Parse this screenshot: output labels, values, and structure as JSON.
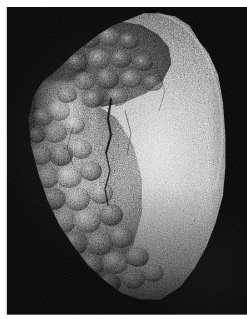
{
  "page": {
    "width": 247,
    "height": 319,
    "background_color": "#ffffff",
    "type": "photographic-plate"
  },
  "photo": {
    "name": "specimen-photograph",
    "subject": "mineral rock specimen",
    "background_color": "#050505",
    "frame": {
      "left": 7,
      "top": 7,
      "width": 240,
      "height": 308
    },
    "lighting": "directional light from upper right",
    "alt_text": "Grayscale photograph of an angular rock specimen on a black background"
  },
  "specimen": {
    "name": "rock-specimen",
    "outline": "irregular angular wedge, wider at top, tapering to a rounded point at lower right",
    "regions": [
      {
        "id": "bright-granular-face",
        "label": "bright fine-grained sugary face",
        "position": "right and centre",
        "tone": "#b4b4b4",
        "texture": "fine granular speckle"
      },
      {
        "id": "dark-crust-recess",
        "label": "dark recessed nodular crust",
        "position": "upper left of centre",
        "tone": "#343434",
        "texture": "coarse botryoidal nodules in shadow"
      },
      {
        "id": "botryoidal-nodular-zone",
        "label": "botryoidal nodular surface",
        "position": "lower left",
        "tone": "#6b6b6b",
        "texture": "rounded grape-like nodules"
      },
      {
        "id": "highlight-lobe",
        "label": "bright illuminated lobe",
        "position": "left of centre, upper third",
        "tone": "#dcdcdc",
        "texture": "smooth highlight"
      }
    ],
    "features": [
      {
        "id": "vertical-fracture",
        "label": "vertical fracture line",
        "position": "centre, running top to bottom"
      },
      {
        "id": "shadow-terminator",
        "label": "shadowed lower-left margin",
        "position": "lower left"
      },
      {
        "id": "rim-highlight",
        "label": "rim highlight",
        "position": "upper right silhouette"
      }
    ],
    "palette": {
      "brightest": "#e6e6e6",
      "mid": "#8c8c8c",
      "shadow": "#2a2a2a",
      "background": "#050505"
    }
  },
  "margins": {
    "left_label": "page margin left",
    "top_label": "page margin top",
    "bottom_label": "page margin bottom",
    "color": "#ffffff"
  }
}
